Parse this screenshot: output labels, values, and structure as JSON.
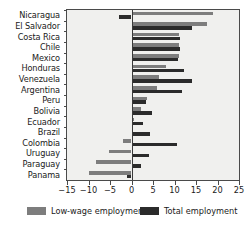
{
  "chart_data": {
    "type": "bar",
    "orientation": "horizontal",
    "title": "",
    "xlabel": "",
    "ylabel": "",
    "xlim": [
      -15,
      25
    ],
    "xticks": [
      -15,
      -10,
      -5,
      0,
      5,
      10,
      15,
      20,
      25
    ],
    "xticklabels": [
      "−15",
      "−10",
      "−5",
      "0",
      "5",
      "10",
      "15",
      "20",
      "25"
    ],
    "grid": false,
    "legend_position": "bottom",
    "categories": [
      "Nicaragua",
      "El Salvador",
      "Costa Rica",
      "Chile",
      "Mexico",
      "Honduras",
      "Venezuela",
      "Argentina",
      "Peru",
      "Bolivia",
      "Ecuador",
      "Brazil",
      "Colombia",
      "Uruguay",
      "Paraguay",
      "Panama"
    ],
    "series": [
      {
        "name": "Low-wage employment",
        "color": "#7d7d7d",
        "values": [
          19.0,
          17.5,
          11.0,
          11.0,
          11.0,
          8.0,
          6.5,
          6.0,
          3.5,
          2.2,
          0.6,
          0.1,
          -2.0,
          -5.3,
          -8.2,
          -9.8
        ]
      },
      {
        "name": "Total employment",
        "color": "#2b2b2b",
        "values": [
          -3.0,
          14.0,
          11.3,
          11.3,
          10.8,
          12.2,
          14.0,
          11.7,
          3.3,
          4.8,
          2.7,
          4.3,
          10.5,
          4.0,
          2.3,
          -1.0
        ]
      }
    ]
  },
  "legend": {
    "low_label": "Low-wage employment",
    "total_label": "Total employment"
  }
}
